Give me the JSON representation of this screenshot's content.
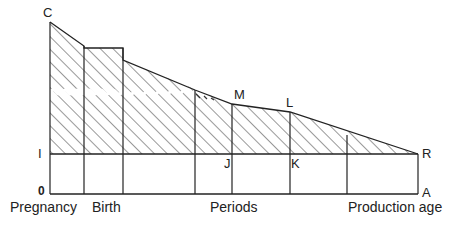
{
  "diagram": {
    "point_labels": {
      "C": "C",
      "M": "M",
      "L": "L",
      "I": "I",
      "J": "J",
      "K": "K",
      "R": "R",
      "O": "0",
      "A": "A"
    },
    "axis_labels": {
      "pregnancy": "Pregnancy",
      "birth": "Birth",
      "periods": "Periods",
      "production_age": "Production age"
    },
    "colors": {
      "line": "#222222",
      "hatch": "#333333",
      "background": "#ffffff"
    }
  }
}
